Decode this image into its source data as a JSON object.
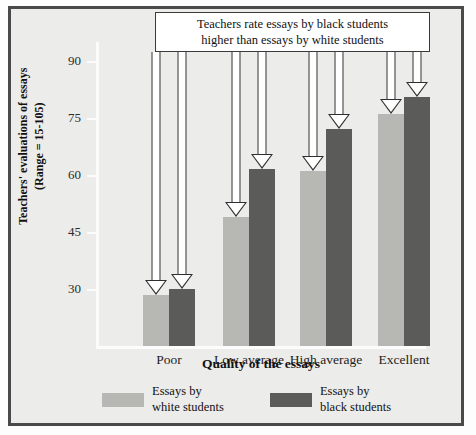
{
  "figure": {
    "callout": {
      "line1": "Teachers rate essays by black students",
      "line2": "higher than essays by white students"
    },
    "legend": [
      {
        "label_line1": "Essays by",
        "label_line2": "white students",
        "color": "#b7b8b4",
        "series": "white"
      },
      {
        "label_line1": "Essays by",
        "label_line2": "black students",
        "color": "#5b5c5a",
        "series": "black"
      }
    ],
    "axis": {
      "y_title_line1": "Teachers' evaluations of essays",
      "y_title_line2": "(Range = 15-105)",
      "x_title": "Quality of the essays"
    },
    "colors": {
      "frame": "#4a4a4a",
      "background": "#ececea",
      "light_bar": "#b7b8b4",
      "dark_bar": "#5b5c5a",
      "callout_border": "#3a3a3a",
      "arrow_fill": "#ffffff",
      "arrow_outline": "#2f2f2f"
    }
  },
  "chart_data": {
    "type": "bar",
    "title": "",
    "categories": [
      "Poor",
      "Low average",
      "High average",
      "Excellent"
    ],
    "series": [
      {
        "name": "Essays by white students",
        "color": "#b7b8b4",
        "values": [
          28.5,
          49,
          61,
          76
        ]
      },
      {
        "name": "Essays by black students",
        "color": "#5b5c5a",
        "values": [
          30,
          61.5,
          72,
          80.5
        ]
      }
    ],
    "xlabel": "Quality of the essays",
    "ylabel": "Teachers' evaluations of essays (Range = 15-105)",
    "yticks": [
      30,
      45,
      60,
      75,
      90
    ],
    "ytick_labels": [
      "30",
      "45",
      "60",
      "75",
      "90"
    ],
    "ylim": [
      15,
      95
    ],
    "grid": false,
    "legend_position": "bottom",
    "annotations": [
      {
        "text": "Teachers rate essays by black students higher than essays by white students",
        "type": "callout-box-with-arrows",
        "points_to": [
          "Poor",
          "Low average",
          "High average",
          "Excellent"
        ]
      }
    ]
  }
}
